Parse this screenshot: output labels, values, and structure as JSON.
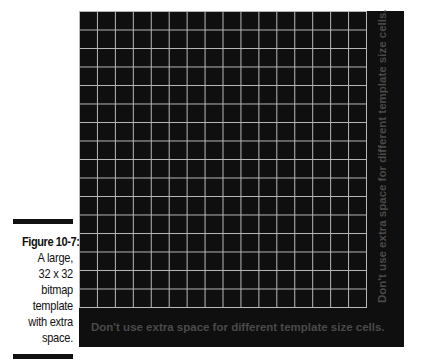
{
  "caption": {
    "label": "Figure 10-7:",
    "lines": [
      "A large,",
      "32 x 32",
      "bitmap",
      "template",
      "with extra",
      "space."
    ]
  },
  "figure": {
    "grid": {
      "columns": 16,
      "rows": 16,
      "line_color": "#b8b8b8",
      "background_color": "#0f0f0f"
    },
    "bottom_note": "Don't use extra space for different template size cells.",
    "side_note": "Don't use extra space for different template size cells.",
    "note_color": "#4a4a4a"
  }
}
